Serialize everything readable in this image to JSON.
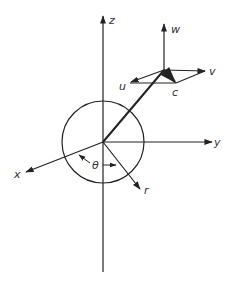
{
  "diagram": {
    "type": "3d-coordinate-velocity-diagram",
    "colors": {
      "ink": "#222222",
      "label": "#333333",
      "background": "#ffffff"
    },
    "labels": {
      "z": "z",
      "y": "y",
      "x": "x",
      "r": "r",
      "theta": "θ",
      "w": "w",
      "v": "v",
      "u": "u",
      "c": "c"
    },
    "elements": [
      "z-axis (vertical)",
      "y-axis (horizontal, right)",
      "x-axis (oblique, lower-left)",
      "r radial vector (lower-right)",
      "circle centered at origin",
      "angle theta between x and r",
      "position line from origin to point",
      "velocity components w (up), v (right), u (left-down), resultant c"
    ]
  }
}
